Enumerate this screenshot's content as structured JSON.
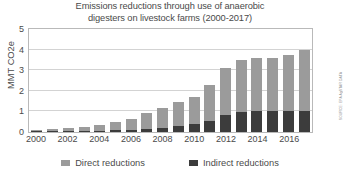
{
  "chart_data": {
    "type": "bar",
    "title": "Emissions reductions through use of anaerobic digesters on livestock farms (2000-2017)",
    "title_lines": [
      "Emissions reductions through use of anaerobic",
      "digesters on livestock farms (2000-2017)"
    ],
    "xlabel": "",
    "ylabel": "MMT CO2e",
    "ylim": [
      0,
      5
    ],
    "yticks": [
      0,
      1,
      2,
      3,
      4,
      5
    ],
    "ytick_labels": [
      "0",
      "1",
      "2",
      "3",
      "4",
      "5"
    ],
    "grid": true,
    "stacked": true,
    "legend_position": "bottom",
    "categories": [
      "2000",
      "2001",
      "2002",
      "2003",
      "2004",
      "2005",
      "2006",
      "2007",
      "2008",
      "2009",
      "2010",
      "2011",
      "2012",
      "2013",
      "2014",
      "2015",
      "2016",
      "2017"
    ],
    "xtick_labels": [
      "2000",
      "2002",
      "2004",
      "2006",
      "2008",
      "2010",
      "2012",
      "2014",
      "2016"
    ],
    "series": [
      {
        "name": "Indirect reductions",
        "color": "#3c3c3c",
        "values": [
          0.02,
          0.03,
          0.04,
          0.05,
          0.06,
          0.08,
          0.1,
          0.14,
          0.2,
          0.28,
          0.4,
          0.55,
          0.85,
          0.95,
          1.0,
          1.0,
          1.0,
          1.0
        ]
      },
      {
        "name": "Direct reductions",
        "color": "#9b9b9b",
        "values": [
          0.03,
          0.12,
          0.16,
          0.21,
          0.29,
          0.42,
          0.55,
          0.76,
          0.95,
          1.17,
          1.3,
          1.75,
          2.25,
          2.55,
          2.6,
          2.6,
          2.75,
          3.0
        ]
      }
    ],
    "totals": [
      0.05,
      0.15,
      0.2,
      0.26,
      0.35,
      0.5,
      0.65,
      0.9,
      1.15,
      1.45,
      1.7,
      2.3,
      3.1,
      3.5,
      3.6,
      3.6,
      3.75,
      4.0
    ]
  },
  "legend": {
    "items": [
      {
        "label": "Direct reductions",
        "color": "#9b9b9b",
        "key": "direct"
      },
      {
        "label": "Indirect reductions",
        "color": "#3c3c3c",
        "key": "indirect"
      }
    ]
  },
  "source_credit": "SOURCE: EPA AgSTAR DATA"
}
